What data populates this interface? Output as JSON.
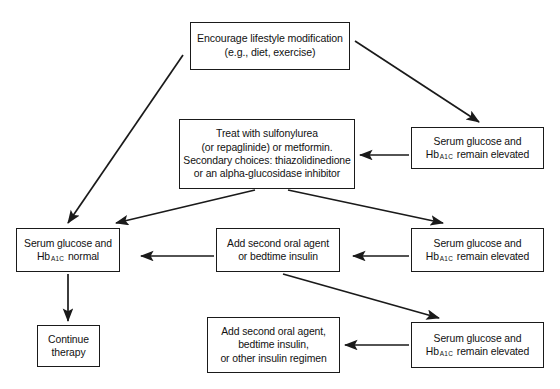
{
  "diagram": {
    "background_color": "#ffffff",
    "line_color": "#1a1a1a",
    "text_color": "#111111",
    "nodes": [
      {
        "id": "lifestyle",
        "name": "encourage-lifestyle-modification-box",
        "lines": [
          "Encourage lifestyle modification",
          "(e.g., diet, exercise)"
        ]
      },
      {
        "id": "treat",
        "name": "treat-with-sulfonylurea-box",
        "lines": [
          "Treat with sulfonylurea",
          "(or repaglinide) or metformin.",
          "Secondary choices: thiazolidinedione",
          "or an alpha-glucosidase inhibitor"
        ]
      },
      {
        "id": "elevated_1",
        "name": "serum-glucose-elevated-box-1",
        "line1": "Serum glucose and",
        "line2_prefix": "Hb",
        "line2_sub": "A1C",
        "line2_suffix": "remain elevated"
      },
      {
        "id": "normal",
        "name": "serum-glucose-normal-box",
        "line1": "Serum glucose and",
        "line2_prefix": "Hb",
        "line2_sub": "A1C",
        "line2_suffix": "normal"
      },
      {
        "id": "add_second",
        "name": "add-second-oral-agent-box",
        "lines": [
          "Add second oral agent",
          "or bedtime insulin"
        ]
      },
      {
        "id": "elevated_2",
        "name": "serum-glucose-elevated-box-2",
        "line1": "Serum glucose and",
        "line2_prefix": "Hb",
        "line2_sub": "A1C",
        "line2_suffix": "remain elevated"
      },
      {
        "id": "continue",
        "name": "continue-therapy-box",
        "lines": [
          "Continue",
          "therapy"
        ]
      },
      {
        "id": "add_regimen",
        "name": "add-second-oral-agent-bedtime-insulin-box",
        "lines": [
          "Add second oral agent,",
          "bedtime insulin,",
          "or other insulin regimen"
        ]
      },
      {
        "id": "elevated_3",
        "name": "serum-glucose-elevated-box-3",
        "line1": "Serum glucose and",
        "line2_prefix": "Hb",
        "line2_sub": "A1C",
        "line2_suffix": "remain elevated"
      }
    ],
    "edges": [
      {
        "name": "edge-lifestyle-to-elevated-1",
        "from": "lifestyle",
        "to": "elevated_1",
        "style": "diagonal-down-right"
      },
      {
        "name": "edge-lifestyle-to-normal",
        "from": "lifestyle",
        "to": "normal",
        "style": "diagonal-down-left"
      },
      {
        "name": "edge-elevated-1-to-treat",
        "from": "elevated_1",
        "to": "treat",
        "style": "horizontal-left"
      },
      {
        "name": "edge-treat-to-normal",
        "from": "treat",
        "to": "normal",
        "style": "diagonal-down-left"
      },
      {
        "name": "edge-treat-to-elevated-2",
        "from": "treat",
        "to": "elevated_2",
        "style": "diagonal-down-right"
      },
      {
        "name": "edge-elevated-2-to-add-second",
        "from": "elevated_2",
        "to": "add_second",
        "style": "horizontal-left"
      },
      {
        "name": "edge-add-second-to-normal",
        "from": "add_second",
        "to": "normal",
        "style": "horizontal-left"
      },
      {
        "name": "edge-add-second-to-elevated-3",
        "from": "add_second",
        "to": "elevated_3",
        "style": "diagonal-down-right"
      },
      {
        "name": "edge-elevated-3-to-add-regimen",
        "from": "elevated_3",
        "to": "add_regimen",
        "style": "horizontal-left"
      },
      {
        "name": "edge-normal-to-continue",
        "from": "normal",
        "to": "continue",
        "style": "vertical-down"
      }
    ]
  }
}
